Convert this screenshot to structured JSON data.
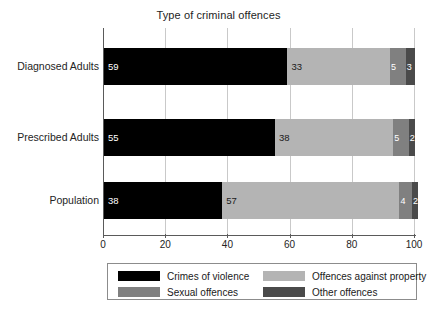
{
  "chart_data": {
    "type": "bar",
    "orientation": "horizontal",
    "stacked": true,
    "title": "Type of criminal offences",
    "xlabel": "",
    "ylabel": "",
    "xlim": [
      0,
      100
    ],
    "xticks": [
      0,
      20,
      40,
      60,
      80,
      100
    ],
    "xtick_labels": [
      "0",
      "20",
      "40",
      "60",
      "80",
      "100"
    ],
    "grid": true,
    "legend_position": "bottom",
    "categories": [
      "Diagnosed Adults",
      "Prescribed Adults",
      "Population"
    ],
    "series": [
      {
        "name": "Crimes of violence",
        "color": "#000000",
        "values": [
          59,
          55,
          38
        ],
        "labels": [
          "59",
          "55",
          "38"
        ]
      },
      {
        "name": "Offences against property",
        "color": "#b4b4b4",
        "values": [
          33,
          38,
          57
        ],
        "labels": [
          "33",
          "38",
          "57"
        ]
      },
      {
        "name": "Sexual offences",
        "color": "#808080",
        "values": [
          5,
          5,
          4
        ],
        "labels": [
          "5",
          "5",
          "4"
        ]
      },
      {
        "name": "Other offences",
        "color": "#4a4a4a",
        "values": [
          3,
          2,
          2
        ],
        "labels": [
          "3",
          "2",
          "2"
        ]
      }
    ]
  },
  "legend": {
    "entries": [
      {
        "label": "Crimes of violence",
        "color": "#000000"
      },
      {
        "label": "Sexual offences",
        "color": "#808080"
      },
      {
        "label": "Offences against property",
        "color": "#b4b4b4"
      },
      {
        "label": "Other offences",
        "color": "#4a4a4a"
      }
    ]
  }
}
